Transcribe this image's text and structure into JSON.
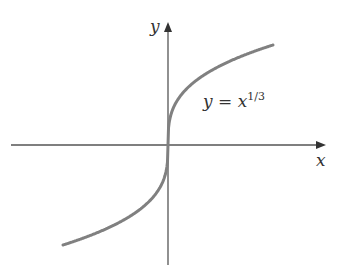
{
  "chart_data": {
    "type": "line",
    "title": "",
    "xlabel": "x",
    "ylabel": "y",
    "annotations": [
      {
        "text": "y = x^(1/3)",
        "position": "upper right of origin, near curve"
      }
    ],
    "series": [
      {
        "name": "y = x^(1/3)",
        "function": "cube_root",
        "x": [
          -1,
          -0.8,
          -0.6,
          -0.4,
          -0.2,
          -0.1,
          -0.02,
          0,
          0.02,
          0.1,
          0.2,
          0.4,
          0.6,
          0.8,
          1
        ],
        "values": [
          -1,
          -0.928,
          -0.843,
          -0.737,
          -0.585,
          -0.464,
          -0.271,
          0,
          0.271,
          0.464,
          0.585,
          0.737,
          0.843,
          0.928,
          1
        ]
      }
    ],
    "xlim": [
      -1.5,
      1.7
    ],
    "ylim": [
      -1.2,
      1.45
    ],
    "grid": false,
    "legend": "none",
    "axes": "cross at origin with arrowheads on positive ends"
  },
  "labels": {
    "x_axis": "x",
    "y_axis": "y",
    "equation_base": "y = x",
    "equation_exponent": "1/3"
  },
  "colors": {
    "curve": "#808080",
    "axes": "#555555",
    "text": "#333333"
  }
}
